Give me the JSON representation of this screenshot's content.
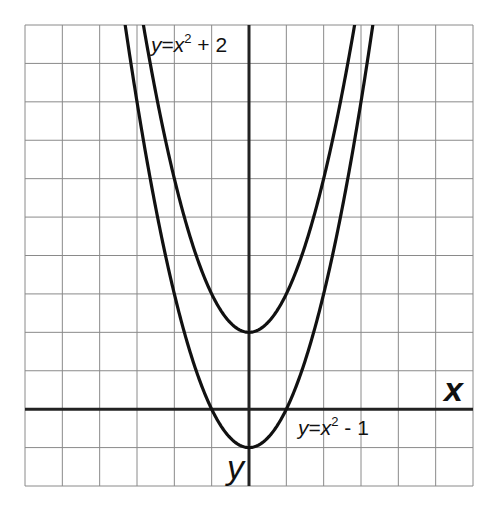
{
  "chart_data": {
    "type": "line",
    "title": "",
    "xlabel": "x",
    "ylabel": "y",
    "xlim": [
      -6,
      6
    ],
    "ylim": [
      -2,
      10
    ],
    "grid": true,
    "grid_step": 1,
    "series": [
      {
        "name": "y=x^2 + 2",
        "label_prefix": "y=x",
        "label_exp": "2",
        "label_suffix": " + 2",
        "a": 1,
        "c": 2,
        "vertex": [
          0,
          2
        ]
      },
      {
        "name": "y=x^2 - 1",
        "label_prefix": "y=x",
        "label_exp": "2",
        "label_suffix": " - 1",
        "a": 1,
        "c": -1,
        "vertex": [
          0,
          -1
        ],
        "roots": [
          -1,
          1
        ]
      }
    ],
    "colors": {
      "curve": "#111111",
      "axis": "#222222",
      "grid": "#8a8a8a"
    }
  },
  "labels": {
    "x_axis": "x",
    "y_axis": "y",
    "upper_eq": {
      "y": "y",
      "eq": "=",
      "x": "x",
      "exp": "2",
      "rest": " + 2"
    },
    "lower_eq": {
      "y": "y",
      "eq": "=",
      "x": "x",
      "exp": "2",
      "rest": " - 1"
    }
  }
}
